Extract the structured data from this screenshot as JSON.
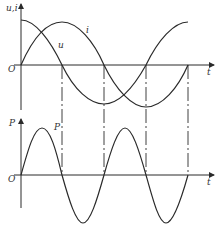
{
  "top_plot": {
    "y_label": "u,i",
    "x_label": "t",
    "origin_label": "O",
    "curve_u_label": "u",
    "curve_i_label": "i"
  },
  "bottom_plot": {
    "y_label": "P",
    "x_label": "t",
    "origin_label": "O",
    "curve_p_label": "P"
  },
  "colors": {
    "line": "#2a2a2a",
    "background": "#ffffff"
  }
}
